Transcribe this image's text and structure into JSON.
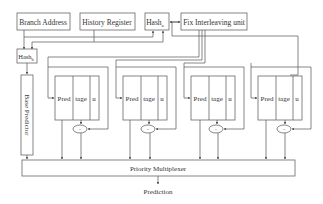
{
  "diagram": {
    "inputs": {
      "branch_address": "Branch Address",
      "history_register": "History Register"
    },
    "hash_top": {
      "label": "Hash",
      "sub": "a"
    },
    "hash_left": {
      "label": "Hash",
      "sub": "b"
    },
    "fix_unit": "Fix Interleaving unit",
    "base_predictor": "Base Predictor",
    "tables": [
      {
        "pred": "Pred",
        "tage": "tage",
        "u": "u",
        "comparator": "="
      },
      {
        "pred": "Pred",
        "tage": "tage",
        "u": "u",
        "comparator": "="
      },
      {
        "pred": "Pred",
        "tage": "tage",
        "u": "u",
        "comparator": "="
      },
      {
        "pred": "Pred",
        "tage": "tage",
        "u": "u",
        "comparator": "="
      }
    ],
    "multiplexer": "Priority Multiplexer",
    "output": "Prediction"
  },
  "colors": {
    "line": "#555555",
    "text": "#333333",
    "background": "#ffffff"
  }
}
